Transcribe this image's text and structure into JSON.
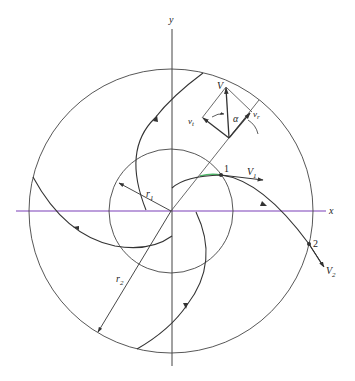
{
  "diagram": {
    "colors": {
      "stroke": "#333333",
      "x_axis": "#7a3fb8",
      "highlight_arc": "#4fb86a",
      "background": "#ffffff"
    },
    "axes": {
      "x_label": "x",
      "y_label": "y"
    },
    "circles": {
      "inner_label": "r",
      "inner_sub": "1",
      "outer_label": "r",
      "outer_sub": "2"
    },
    "points": [
      {
        "id": "1",
        "label": "1",
        "velocity_label": "V",
        "velocity_sub": "1"
      },
      {
        "id": "2",
        "label": "2",
        "velocity_label": "V",
        "velocity_sub": "2"
      }
    ],
    "velocity_diagram": {
      "resultant_label": "V",
      "radial_label": "v",
      "radial_sub": "r",
      "tangential_label": "v",
      "tangential_sub": "t",
      "angle_label": "α"
    }
  }
}
